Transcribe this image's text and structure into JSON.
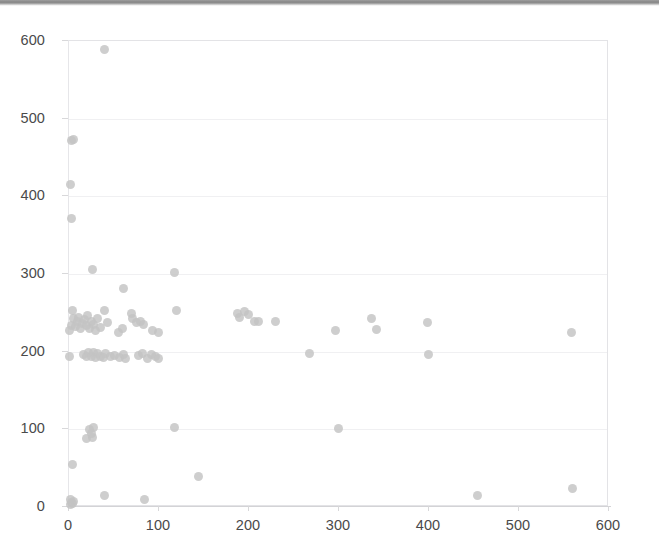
{
  "chart_data": {
    "type": "scatter",
    "title": "",
    "subtitle": "",
    "xlabel": "",
    "ylabel": "",
    "xlim": [
      0,
      600
    ],
    "ylim": [
      0,
      600
    ],
    "xticks": [
      0,
      100,
      200,
      300,
      400,
      500,
      600
    ],
    "yticks": [
      0,
      100,
      200,
      300,
      400,
      500,
      600
    ],
    "grid": "horizontal",
    "legend": "none",
    "marker": {
      "shape": "circle",
      "color": "#c3c3c3",
      "size": 9,
      "opacity": 0.82
    },
    "series": [
      {
        "name": "series-1",
        "points": [
          [
            3,
            2
          ],
          [
            4,
            4
          ],
          [
            5,
            3
          ],
          [
            6,
            6
          ],
          [
            3,
            8
          ],
          [
            5,
            53
          ],
          [
            40,
            13
          ],
          [
            85,
            9
          ],
          [
            145,
            38
          ],
          [
            455,
            14
          ],
          [
            560,
            22
          ],
          [
            20,
            87
          ],
          [
            27,
            88
          ],
          [
            24,
            99
          ],
          [
            28,
            101
          ],
          [
            26,
            93
          ],
          [
            118,
            101
          ],
          [
            300,
            100
          ],
          [
            2,
            193
          ],
          [
            17,
            195
          ],
          [
            20,
            192
          ],
          [
            23,
            197
          ],
          [
            26,
            193
          ],
          [
            28,
            198
          ],
          [
            30,
            191
          ],
          [
            33,
            196
          ],
          [
            36,
            193
          ],
          [
            39,
            191
          ],
          [
            42,
            196
          ],
          [
            47,
            192
          ],
          [
            52,
            194
          ],
          [
            57,
            191
          ],
          [
            62,
            195
          ],
          [
            64,
            190
          ],
          [
            78,
            194
          ],
          [
            83,
            196
          ],
          [
            88,
            190
          ],
          [
            93,
            195
          ],
          [
            97,
            192
          ],
          [
            100,
            190
          ],
          [
            268,
            196
          ],
          [
            400,
            195
          ],
          [
            2,
            226
          ],
          [
            4,
            233
          ],
          [
            6,
            241
          ],
          [
            5,
            252
          ],
          [
            8,
            231
          ],
          [
            10,
            237
          ],
          [
            12,
            243
          ],
          [
            14,
            228
          ],
          [
            16,
            235
          ],
          [
            18,
            240
          ],
          [
            20,
            232
          ],
          [
            22,
            245
          ],
          [
            24,
            229
          ],
          [
            26,
            238
          ],
          [
            28,
            234
          ],
          [
            30,
            226
          ],
          [
            33,
            241
          ],
          [
            36,
            230
          ],
          [
            40,
            252
          ],
          [
            44,
            236
          ],
          [
            56,
            224
          ],
          [
            60,
            228
          ],
          [
            62,
            280
          ],
          [
            70,
            248
          ],
          [
            72,
            241
          ],
          [
            76,
            236
          ],
          [
            80,
            238
          ],
          [
            84,
            234
          ],
          [
            94,
            226
          ],
          [
            100,
            223
          ],
          [
            27,
            305
          ],
          [
            118,
            301
          ],
          [
            120,
            252
          ],
          [
            188,
            248
          ],
          [
            191,
            243
          ],
          [
            196,
            251
          ],
          [
            200,
            246
          ],
          [
            207,
            238
          ],
          [
            212,
            237
          ],
          [
            230,
            237
          ],
          [
            297,
            226
          ],
          [
            337,
            241
          ],
          [
            343,
            227
          ],
          [
            399,
            236
          ],
          [
            559,
            224
          ],
          [
            4,
            470
          ],
          [
            6,
            472
          ],
          [
            3,
            414
          ],
          [
            4,
            370
          ],
          [
            41,
            588
          ]
        ]
      }
    ]
  },
  "axes": {
    "y_labels": [
      "600",
      "500",
      "400",
      "300",
      "200",
      "100",
      "0"
    ],
    "y_values": [
      600,
      500,
      400,
      300,
      200,
      100,
      0
    ],
    "x_labels": [
      "0",
      "100",
      "200",
      "300",
      "400",
      "500",
      "600"
    ],
    "x_values": [
      0,
      100,
      200,
      300,
      400,
      500,
      600
    ]
  },
  "style": {
    "marker_color": "#c3c3c3",
    "grid_color": "#f0f0f2",
    "frame_color": "#e3e3e6",
    "tick_text_color": "#4a4a4a",
    "background": "#ffffff"
  }
}
